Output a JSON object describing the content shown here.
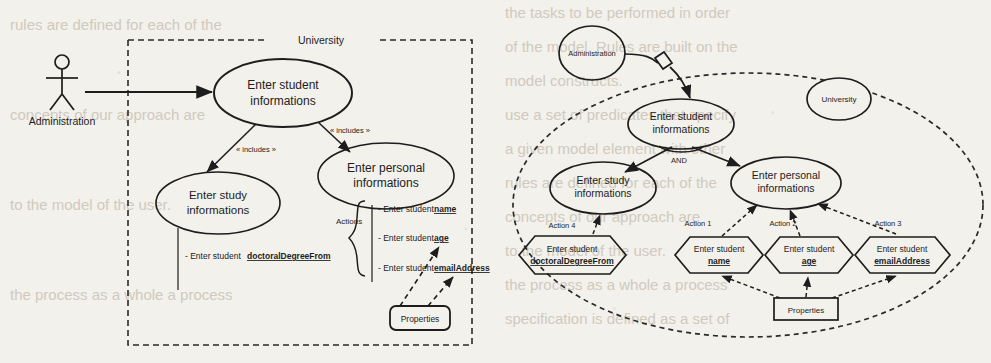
{
  "figure": {
    "background_color": "#f3f1ec",
    "ink_color": "#1d1d1d",
    "panels": [
      "use-case-diagram",
      "goal-decomposition-diagram"
    ]
  },
  "left_diagram": {
    "boundary_label": "University",
    "actor": {
      "name": "Administration",
      "label": "Administration"
    },
    "use_cases": [
      {
        "id": "uc-student",
        "label_line1": "Enter student",
        "label_line2": "informations"
      },
      {
        "id": "uc-study",
        "label_line1": "Enter study",
        "label_line2": "informations"
      },
      {
        "id": "uc-personal",
        "label_line1": "Enter personal",
        "label_line2": "informations"
      }
    ],
    "stereotypes": [
      {
        "id": "includes-study",
        "label": "« includes »"
      },
      {
        "id": "includes-personal",
        "label": "« includes »"
      }
    ],
    "notes": [
      {
        "id": "note-study",
        "prefix": "- Enter student ",
        "attribute": "doctoralDegreeFrom"
      }
    ],
    "actions_bracket_label": "Actions",
    "action_notes": [
      {
        "id": "action-name",
        "prefix": "- Enter student ",
        "attribute": "name"
      },
      {
        "id": "action-age",
        "prefix": "- Enter student ",
        "attribute": "age"
      },
      {
        "id": "action-email",
        "prefix": "- Enter student ",
        "attribute": "emailAddress"
      }
    ],
    "properties_box": {
      "label": "Properties"
    }
  },
  "right_diagram": {
    "boundary_label": "University",
    "actor_node": {
      "label": "Administration"
    },
    "goals": [
      {
        "id": "goal-student",
        "label_line1": "Enter student",
        "label_line2": "informations"
      },
      {
        "id": "goal-study",
        "label_line1": "Enter study",
        "label_line2": "informations"
      },
      {
        "id": "goal-personal",
        "label_line1": "Enter personal",
        "label_line2": "informations"
      }
    ],
    "decomposition_operator": "AND",
    "action_labels": [
      {
        "id": "label-action-4",
        "label": "Action 4"
      },
      {
        "id": "label-action-1",
        "label": "Action 1"
      },
      {
        "id": "label-action-2",
        "label": "Action 2"
      },
      {
        "id": "label-action-3",
        "label": "Action 3"
      }
    ],
    "action_tasks": [
      {
        "id": "task-doctoral",
        "line1": "Enter student",
        "attribute": "doctoralDegreeFrom"
      },
      {
        "id": "task-name",
        "line1": "Enter student",
        "attribute": "name"
      },
      {
        "id": "task-age",
        "line1": "Enter student",
        "attribute": "age"
      },
      {
        "id": "task-email",
        "line1": "Enter student",
        "attribute": "emailAddress"
      }
    ],
    "properties_box": {
      "label": "Properties"
    }
  },
  "background_bleed": {
    "lines": [
      "the tasks to be performed in order",
      "of the model. Rules are built on the",
      "model constructs.",
      "use a set of predicates that specify",
      "a given model element with other",
      "rules are defined for each of the",
      "concepts of our approach are",
      "to the model of the user.",
      "the process as a whole a process",
      "specification is defined as a set of"
    ]
  }
}
